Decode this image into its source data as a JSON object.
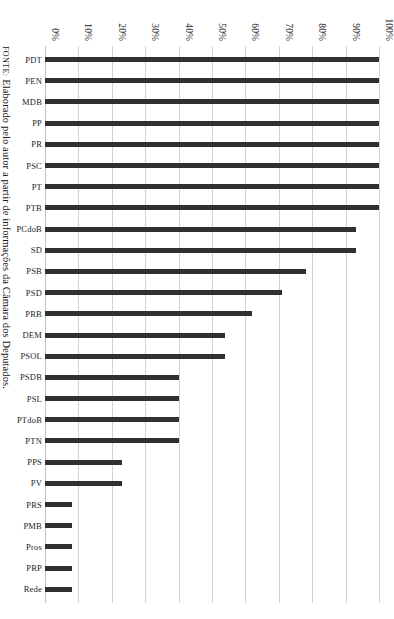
{
  "figure": {
    "caption_prefix": "FONTE:",
    "caption_text": "Elaborado pelo autor a partir de informações da Câmara dos Deputados.",
    "bar_color": "#303030",
    "gridline_color": "#d2d2d2",
    "background_color": "#ffffff"
  },
  "chart_data": {
    "type": "bar",
    "title": "",
    "subtitle": "",
    "xlabel": "",
    "ylabel": "",
    "ylim": [
      0,
      100
    ],
    "ytick_labels": [
      "0%",
      "10%",
      "20%",
      "30%",
      "40%",
      "50%",
      "60%",
      "70%",
      "80%",
      "90%",
      "100%"
    ],
    "ytick_values": [
      0,
      10,
      20,
      30,
      40,
      50,
      60,
      70,
      80,
      90,
      100
    ],
    "grid": true,
    "legend": false,
    "legend_position": "none",
    "orientation": "vertical-bars-rotated-page",
    "categories": [
      "PDT",
      "PEN",
      "MDB",
      "PP",
      "PR",
      "PSC",
      "PT",
      "PTB",
      "PCdoB",
      "SD",
      "PSB",
      "PSD",
      "PRB",
      "DEM",
      "PSOL",
      "PSDB",
      "PSL",
      "PTdoB",
      "PTN",
      "PPS",
      "PV",
      "PRS",
      "PMB",
      "Pros",
      "PRP",
      "Rede"
    ],
    "values": [
      100,
      100,
      100,
      100,
      100,
      100,
      100,
      100,
      93,
      93,
      78,
      71,
      62,
      54,
      54,
      40,
      40,
      40,
      40,
      23,
      23,
      8,
      8,
      8,
      8,
      8
    ],
    "units": "percent"
  }
}
